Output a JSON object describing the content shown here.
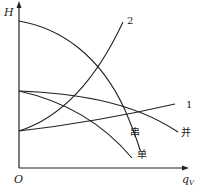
{
  "diagram": {
    "axes": {
      "y_label": "H",
      "x_label": "q",
      "x_label_sub": "V",
      "origin_label": "O"
    },
    "curves": [
      {
        "id": "single",
        "label": "单",
        "kind": "pump-single"
      },
      {
        "id": "series",
        "label": "串",
        "kind": "pump-series"
      },
      {
        "id": "parallel",
        "label": "并",
        "kind": "pump-parallel"
      },
      {
        "id": "pipe1",
        "label": "1",
        "kind": "pipeline-low"
      },
      {
        "id": "pipe2",
        "label": "2",
        "kind": "pipeline-steep"
      }
    ],
    "colors": {
      "line": "#222222",
      "background": "#ffffff"
    }
  }
}
